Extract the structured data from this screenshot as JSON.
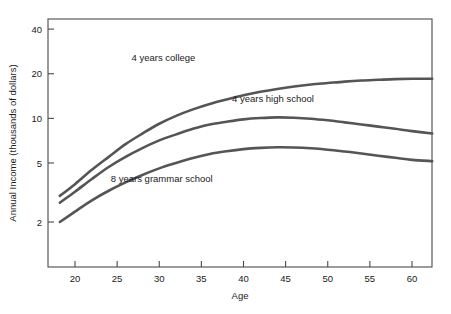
{
  "chart_data": {
    "type": "line",
    "title": "",
    "xlabel": "Age",
    "ylabel": "Annual Income (thousands of dollars)",
    "xlim": [
      16.8,
      62.5
    ],
    "ylim": [
      1.85,
      40
    ],
    "yscale": "log",
    "grid": false,
    "legend_position": "inline-annotations",
    "xticks": [
      20,
      25,
      30,
      35,
      40,
      45,
      50,
      55,
      60
    ],
    "xtick_labels": [
      "20",
      "25",
      "30",
      "35",
      "40",
      "45",
      "50",
      "55",
      "60"
    ],
    "yticks": [
      2,
      5,
      10,
      20,
      40
    ],
    "ytick_labels": [
      "2",
      "5",
      "10",
      "20",
      "40"
    ],
    "series": [
      {
        "name": "4 years college",
        "label": "4 years college",
        "label_x": 30.5,
        "label_y": 24.5,
        "x": [
          18.2,
          20,
          22,
          24,
          26,
          28,
          30,
          32,
          34,
          36,
          38,
          40,
          42,
          44,
          46,
          48,
          50,
          52,
          54,
          56,
          58,
          60,
          62.4
        ],
        "values": [
          3.0,
          3.6,
          4.5,
          5.5,
          6.7,
          7.9,
          9.2,
          10.4,
          11.5,
          12.5,
          13.4,
          14.3,
          15.1,
          15.8,
          16.4,
          16.9,
          17.3,
          17.7,
          18.0,
          18.2,
          18.4,
          18.5,
          18.5
        ]
      },
      {
        "name": "4 years high school",
        "label": "4 years high school",
        "label_x": 43.5,
        "label_y": 12.8,
        "x": [
          18.2,
          20,
          22,
          24,
          26,
          28,
          30,
          32,
          34,
          36,
          38,
          40,
          42,
          44,
          46,
          48,
          50,
          52,
          54,
          56,
          58,
          60,
          62.4
        ],
        "values": [
          2.7,
          3.2,
          3.9,
          4.7,
          5.5,
          6.3,
          7.1,
          7.8,
          8.5,
          9.1,
          9.5,
          9.85,
          10.05,
          10.15,
          10.1,
          9.95,
          9.7,
          9.4,
          9.1,
          8.8,
          8.5,
          8.2,
          7.9
        ]
      },
      {
        "name": "8 years grammar school",
        "label": "8 years grammar school",
        "label_x": 30.3,
        "label_y": 3.7,
        "x": [
          18.2,
          20,
          22,
          24,
          26,
          28,
          30,
          32,
          34,
          36,
          38,
          40,
          42,
          44,
          46,
          48,
          50,
          52,
          54,
          56,
          58,
          60,
          62.4
        ],
        "values": [
          2.0,
          2.35,
          2.8,
          3.25,
          3.7,
          4.15,
          4.6,
          5.0,
          5.4,
          5.75,
          6.0,
          6.2,
          6.32,
          6.38,
          6.36,
          6.28,
          6.15,
          5.98,
          5.8,
          5.6,
          5.42,
          5.25,
          5.15
        ]
      }
    ]
  },
  "colors": {
    "line": "#555555",
    "axis": "#4a4a4a",
    "text": "#1a1a1a",
    "background": "#ffffff"
  }
}
